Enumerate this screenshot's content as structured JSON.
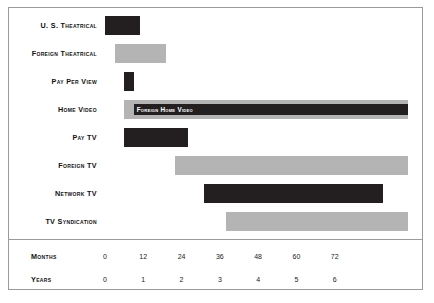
{
  "chart_data": {
    "type": "bar",
    "orientation": "horizontal",
    "subtype": "gantt-timeline",
    "title": "",
    "xlabel": "",
    "ylabel": "",
    "xlim": [
      0,
      78
    ],
    "x_unit": "months",
    "grid": false,
    "legend": "none",
    "colors": {
      "dark": "#231f20",
      "light": "#b4b4b4",
      "frame": "#9a9a9a",
      "background": "#ffffff",
      "label_text": "#111111",
      "inner_label_text": "#ffffff"
    },
    "categories": [
      "U. S. Theatrical",
      "Foreign Theatrical",
      "Pay Per View",
      "Home Video",
      "Pay TV",
      "Foreign TV",
      "Network TV",
      "TV Syndication"
    ],
    "bars": [
      {
        "label": "U. S. Theatrical",
        "start": 0,
        "end": 11,
        "shade": "dark"
      },
      {
        "label": "Foreign Theatrical",
        "start": 3,
        "end": 19,
        "shade": "light"
      },
      {
        "label": "Pay Per View",
        "start": 6,
        "end": 9,
        "shade": "dark"
      },
      {
        "label": "Home Video",
        "start": 6,
        "end": 95,
        "shade": "light",
        "inner": {
          "text": "Foreign Home Video",
          "start": 9,
          "end": 95,
          "shade": "dark"
        }
      },
      {
        "label": "Pay TV",
        "start": 6,
        "end": 26,
        "shade": "dark"
      },
      {
        "label": "Foreign TV",
        "start": 22,
        "end": 95,
        "shade": "light"
      },
      {
        "label": "Network TV",
        "start": 31,
        "end": 87,
        "shade": "dark"
      },
      {
        "label": "TV Syndication",
        "start": 38,
        "end": 95,
        "shade": "light"
      }
    ],
    "axes": [
      {
        "name": "Months",
        "ticks": [
          "0",
          "12",
          "24",
          "36",
          "48",
          "60",
          "72"
        ],
        "tick_values": [
          0,
          12,
          24,
          36,
          48,
          60,
          72
        ]
      },
      {
        "name": "Years",
        "ticks": [
          "0",
          "1",
          "2",
          "3",
          "4",
          "5",
          "6"
        ],
        "tick_values": [
          0,
          12,
          24,
          36,
          48,
          60,
          72
        ]
      }
    ]
  }
}
